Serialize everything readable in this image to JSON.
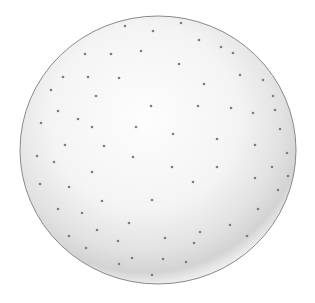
{
  "image": {
    "subject": "dotted sphere illustration",
    "background": "#ffffff",
    "sphere": {
      "cx": 158,
      "cy": 150,
      "rx": 138,
      "ry": 134,
      "fill_light": "#fbfbfb",
      "fill_mid": "#ededed",
      "fill_shadow": "#cfcfcf",
      "outline": "#8a8a8a"
    },
    "dot_color": "#7d7d7d",
    "dot_radius": 1.3,
    "dots": [
      [
        125,
        26
      ],
      [
        153,
        31
      ],
      [
        85,
        54
      ],
      [
        111,
        54
      ],
      [
        141,
        51
      ],
      [
        63,
        77
      ],
      [
        88,
        77
      ],
      [
        119,
        78
      ],
      [
        51,
        90
      ],
      [
        96,
        96
      ],
      [
        151,
        106
      ],
      [
        58,
        111
      ],
      [
        78,
        119
      ],
      [
        92,
        127
      ],
      [
        41,
        123
      ],
      [
        136,
        127
      ],
      [
        65,
        145
      ],
      [
        104,
        146
      ],
      [
        37,
        156
      ],
      [
        133,
        157
      ],
      [
        181,
        23
      ],
      [
        199,
        40
      ],
      [
        221,
        47
      ],
      [
        233,
        53
      ],
      [
        179,
        64
      ],
      [
        240,
        75
      ],
      [
        263,
        80
      ],
      [
        204,
        84
      ],
      [
        198,
        106
      ],
      [
        231,
        108
      ],
      [
        273,
        96
      ],
      [
        275,
        110
      ],
      [
        253,
        113
      ],
      [
        280,
        129
      ],
      [
        173,
        134
      ],
      [
        217,
        139
      ],
      [
        255,
        145
      ],
      [
        287,
        153
      ],
      [
        54,
        162
      ],
      [
        92,
        172
      ],
      [
        40,
        184
      ],
      [
        69,
        187
      ],
      [
        102,
        201
      ],
      [
        152,
        200
      ],
      [
        58,
        209
      ],
      [
        82,
        213
      ],
      [
        129,
        223
      ],
      [
        97,
        230
      ],
      [
        69,
        236
      ],
      [
        118,
        241
      ],
      [
        86,
        248
      ],
      [
        132,
        258
      ],
      [
        119,
        264
      ],
      [
        152,
        275
      ],
      [
        172,
        167
      ],
      [
        217,
        167
      ],
      [
        272,
        167
      ],
      [
        255,
        178
      ],
      [
        288,
        176
      ],
      [
        193,
        182
      ],
      [
        278,
        190
      ],
      [
        258,
        209
      ],
      [
        230,
        225
      ],
      [
        200,
        232
      ],
      [
        165,
        238
      ],
      [
        194,
        243
      ],
      [
        247,
        236
      ],
      [
        163,
        259
      ],
      [
        186,
        262
      ]
    ]
  }
}
